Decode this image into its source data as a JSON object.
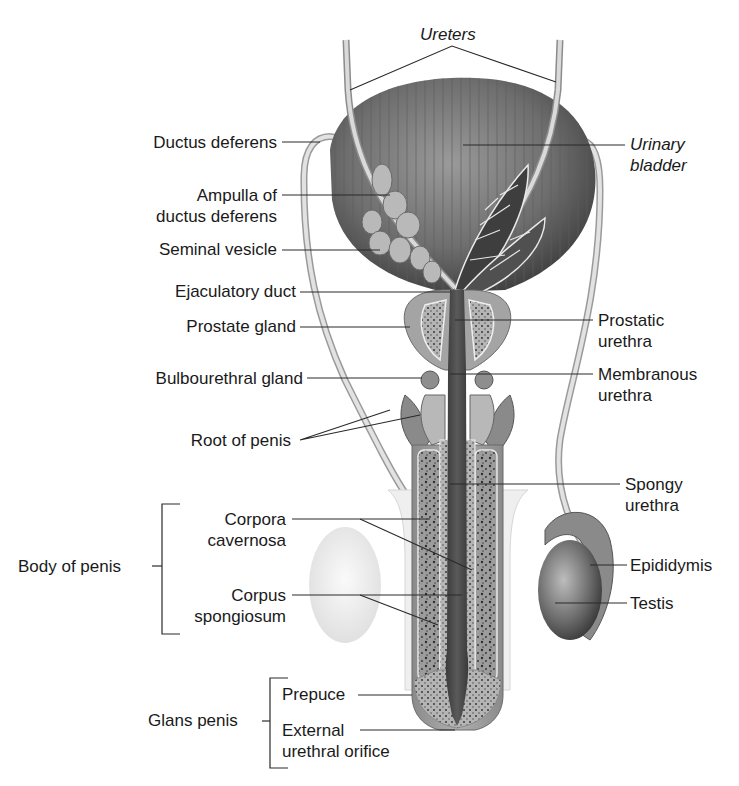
{
  "diagram": {
    "colors": {
      "background": "#ffffff",
      "label_text": "#1a1a1a",
      "leader_line": "#2a2a2a",
      "tissue_dark": "#3a3a3a",
      "tissue_mid": "#7a7a7a",
      "tissue_light": "#c8c8c8"
    },
    "labels": {
      "ureters": "Ureters",
      "urinary_bladder": "Urinary\nbladder",
      "ductus_deferens": "Ductus deferens",
      "ampulla": "Ampulla of\nductus deferens",
      "seminal_vesicle": "Seminal vesicle",
      "ejaculatory_duct": "Ejaculatory duct",
      "prostate_gland": "Prostate gland",
      "prostatic_urethra": "Prostatic\nurethra",
      "bulbourethral_gland": "Bulbourethral gland",
      "membranous_urethra": "Membranous\nurethra",
      "root_of_penis": "Root of penis",
      "spongy_urethra": "Spongy\nurethra",
      "body_of_penis": "Body of penis",
      "corpora_cavernosa": "Corpora\ncavernosa",
      "corpus_spongiosum": "Corpus\nspongiosum",
      "epididymis": "Epididymis",
      "testis": "Testis",
      "glans_penis": "Glans penis",
      "prepuce": "Prepuce",
      "external_urethral_orifice": "External\nurethral orifice"
    }
  }
}
